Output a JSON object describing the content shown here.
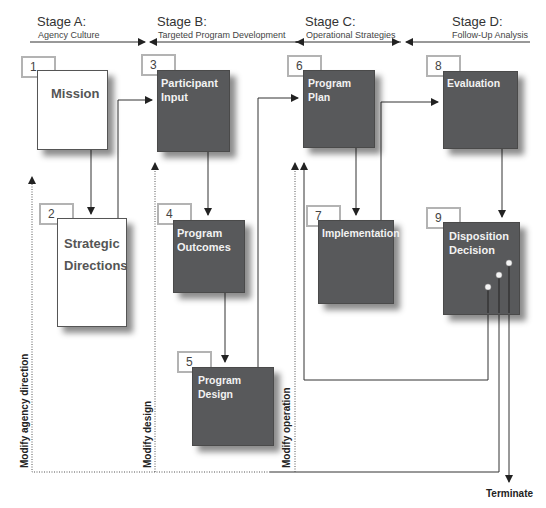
{
  "stages": [
    {
      "id": "A",
      "title": "Stage A:",
      "subtitle": "Agency Culture"
    },
    {
      "id": "B",
      "title": "Stage B:",
      "subtitle": "Targeted Program Development"
    },
    {
      "id": "C",
      "title": "Stage C:",
      "subtitle": "Operational Strategies"
    },
    {
      "id": "D",
      "title": "Stage D:",
      "subtitle": "Follow-Up Analysis"
    }
  ],
  "steps": [
    {
      "number": "1",
      "label": "Mission",
      "style": "white"
    },
    {
      "number": "2",
      "label": "Strategic Directions",
      "style": "white"
    },
    {
      "number": "3",
      "label": "Participant Input",
      "style": "dark"
    },
    {
      "number": "4",
      "label": "Program Outcomes",
      "style": "dark"
    },
    {
      "number": "5",
      "label": "Program Design",
      "style": "dark"
    },
    {
      "number": "6",
      "label": "Program Plan",
      "style": "dark"
    },
    {
      "number": "7",
      "label": "Implementation",
      "style": "dark"
    },
    {
      "number": "8",
      "label": "Evaluation",
      "style": "dark"
    },
    {
      "number": "9",
      "label": "Disposition Decision",
      "style": "dark"
    }
  ],
  "feedback_labels": {
    "modify_agency_direction": "Modify agency direction",
    "modify_design": "Modify design",
    "modify_operation": "Modify operation"
  },
  "terminal": "Terminate",
  "colors": {
    "dark_box": "#58595b",
    "number_border": "#b3b3b3",
    "line": "#333333"
  }
}
